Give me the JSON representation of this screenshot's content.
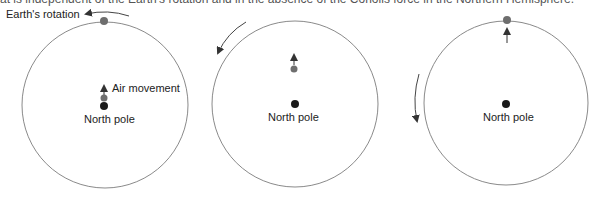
{
  "caption_fragment": "at is independent of the Earth's rotation and in the absence of the Coriolis force in the Northern Hemisphere.",
  "colors": {
    "circle_stroke": "#8a8a8a",
    "pole_dot": "#1a1a1a",
    "air_dot": "#6e6e6e",
    "arrow": "#333333",
    "text": "#222222"
  },
  "panels": [
    {
      "id": "panel-1",
      "rotation_label": "Earth's rotation",
      "air_label": "Air movement",
      "pole_label": "North pole"
    },
    {
      "id": "panel-2",
      "pole_label": "North pole"
    },
    {
      "id": "panel-3",
      "pole_label": "North pole"
    }
  ]
}
